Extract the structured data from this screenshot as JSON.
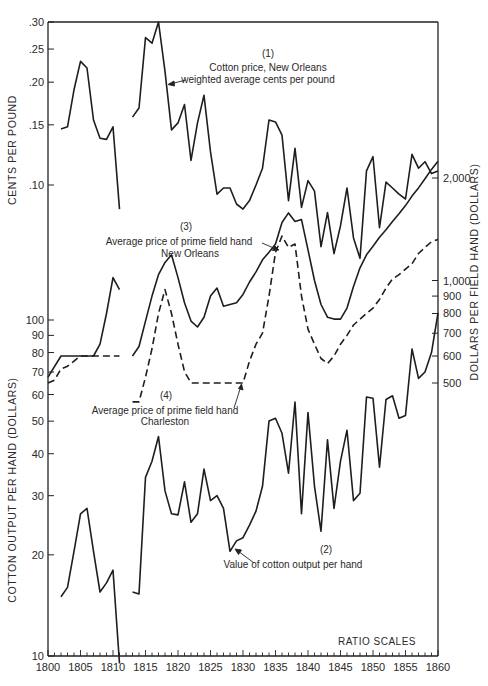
{
  "chart_data": {
    "type": "line",
    "title": "",
    "note": "RATIO SCALES",
    "x": {
      "label": "",
      "range": [
        1800,
        1860
      ],
      "ticks": [
        1800,
        1805,
        1810,
        1815,
        1820,
        1825,
        1830,
        1835,
        1840,
        1845,
        1850,
        1855,
        1860
      ]
    },
    "axes": {
      "left_top": {
        "label": "CENTS PER POUND",
        "ticks": [
          ".30",
          ".25",
          ".20",
          ".15",
          ".10"
        ],
        "scale": "log"
      },
      "left_bottom": {
        "label": "COTTON OUTPUT PER HAND (DOLLARS)",
        "ticks": [
          "100",
          "90",
          "80",
          "70",
          "60",
          "50",
          "40",
          "30",
          "20",
          "10"
        ],
        "scale": "log"
      },
      "right": {
        "label": "DOLLARS PER FIELD HAND (DOLLARS)",
        "ticks": [
          "2,000",
          "1,000",
          "900",
          "800",
          "700",
          "600",
          "500"
        ],
        "scale": "log"
      }
    },
    "grid": false,
    "series": [
      {
        "id": 1,
        "name": "Cotton price, New Orleans weighted average cents per pound",
        "label_number": "(1)",
        "label_lines": [
          "Cotton price, New Orleans",
          "weighted average cents per pound"
        ],
        "axis": "left_top",
        "style": "solid",
        "segments": [
          {
            "x": [
              1802,
              1803,
              1804,
              1805,
              1806,
              1807,
              1808,
              1809,
              1810,
              1811
            ],
            "y": [
              0.146,
              0.148,
              0.19,
              0.23,
              0.22,
              0.155,
              0.137,
              0.136,
              0.148,
              0.085
            ]
          },
          {
            "x": [
              1813,
              1814,
              1815,
              1816,
              1817,
              1818,
              1819,
              1820,
              1821,
              1822,
              1823,
              1824,
              1825,
              1826,
              1827,
              1828,
              1829,
              1830,
              1831,
              1832,
              1833,
              1834,
              1835,
              1836,
              1837,
              1838,
              1839,
              1840,
              1841,
              1842,
              1843,
              1844,
              1845,
              1846,
              1847,
              1848,
              1849,
              1850,
              1851,
              1852,
              1853,
              1854,
              1855,
              1856,
              1857,
              1858,
              1859,
              1860
            ],
            "y": [
              0.158,
              0.168,
              0.27,
              0.26,
              0.3,
              0.215,
              0.145,
              0.152,
              0.172,
              0.118,
              0.152,
              0.183,
              0.125,
              0.094,
              0.098,
              0.098,
              0.088,
              0.085,
              0.09,
              0.1,
              0.112,
              0.155,
              0.153,
              0.14,
              0.09,
              0.128,
              0.086,
              0.103,
              0.096,
              0.066,
              0.083,
              0.063,
              0.076,
              0.098,
              0.07,
              0.061,
              0.11,
              0.121,
              0.075,
              0.102,
              0.098,
              0.094,
              0.091,
              0.123,
              0.112,
              0.117,
              0.108,
              0.11
            ]
          }
        ]
      },
      {
        "id": 2,
        "name": "Value of cotton output per hand",
        "label_number": "(2)",
        "label_lines": [
          "Value of cotton output per hand"
        ],
        "axis": "left_bottom",
        "style": "solid",
        "segments": [
          {
            "x": [
              1802,
              1803,
              1804,
              1805,
              1806,
              1807,
              1808,
              1809,
              1810,
              1811
            ],
            "y": [
              15,
              16,
              20.5,
              26.5,
              27.5,
              20.5,
              15.5,
              16.5,
              18,
              9.5
            ]
          },
          {
            "x": [
              1813,
              1814,
              1815,
              1816,
              1817,
              1818,
              1819,
              1820,
              1821,
              1822,
              1823,
              1824,
              1825,
              1826,
              1827,
              1828,
              1829,
              1830,
              1831,
              1832,
              1833,
              1834,
              1835,
              1836,
              1837,
              1838,
              1839,
              1840,
              1841,
              1842,
              1843,
              1844,
              1845,
              1846,
              1847,
              1848,
              1849,
              1850,
              1851,
              1852,
              1853,
              1854,
              1855,
              1856,
              1857,
              1858,
              1859,
              1860
            ],
            "y": [
              15.5,
              15.3,
              34,
              38,
              45,
              31,
              26.5,
              26.3,
              33,
              25,
              26.5,
              36,
              29,
              30,
              27.5,
              20.5,
              22,
              22.5,
              24.5,
              27,
              32,
              50,
              51,
              46,
              35,
              57,
              26.5,
              53,
              32,
              23.5,
              44,
              27.5,
              38,
              47,
              29,
              30.5,
              59,
              58.5,
              36.5,
              58,
              59.5,
              51,
              52,
              82,
              67,
              70,
              80,
              105
            ]
          }
        ]
      },
      {
        "id": 3,
        "name": "Average price of prime field hand New Orleans",
        "label_number": "(3)",
        "label_lines": [
          "Average price of prime field hand",
          "New Orleans"
        ],
        "axis": "right",
        "style": "solid",
        "segments": [
          {
            "x": [
              1800,
              1802,
              1806,
              1807,
              1808,
              1809,
              1810,
              1811
            ],
            "y": [
              520,
              600,
              600,
              600,
              650,
              800,
              1020,
              940
            ]
          },
          {
            "x": [
              1813,
              1814,
              1815,
              1816,
              1817,
              1818,
              1819,
              1820,
              1821,
              1822,
              1823,
              1824,
              1825,
              1826,
              1827,
              1828,
              1829,
              1830,
              1831,
              1832,
              1833,
              1834,
              1835,
              1836,
              1837,
              1838,
              1839,
              1840,
              1841,
              1842,
              1843,
              1844,
              1845,
              1846,
              1847,
              1848,
              1849,
              1850,
              1851,
              1852,
              1853,
              1854,
              1855,
              1856,
              1857,
              1858,
              1859,
              1860
            ],
            "y": [
              600,
              640,
              760,
              900,
              1040,
              1130,
              1190,
              1020,
              860,
              760,
              730,
              780,
              900,
              950,
              840,
              850,
              860,
              910,
              990,
              1060,
              1150,
              1210,
              1280,
              1480,
              1580,
              1490,
              1510,
              1230,
              1000,
              850,
              780,
              770,
              770,
              830,
              960,
              1090,
              1190,
              1260,
              1340,
              1410,
              1490,
              1570,
              1660,
              1770,
              1870,
              1990,
              2120,
              2240
            ]
          }
        ]
      },
      {
        "id": 4,
        "name": "Average price of prime field hand Charleston",
        "label_number": "(4)",
        "label_lines": [
          "Average price of prime field hand",
          "Charleston"
        ],
        "axis": "right",
        "style": "dashed",
        "segments": [
          {
            "x": [
              1800,
              1801,
              1802,
              1803,
              1804,
              1805,
              1806,
              1807,
              1808,
              1809,
              1810,
              1811
            ],
            "y": [
              500,
              510,
              550,
              560,
              580,
              600,
              600,
              600,
              600,
              600,
              600,
              600
            ]
          },
          {
            "x": [
              1813,
              1814,
              1815,
              1816,
              1817,
              1818,
              1819,
              1820,
              1821,
              1822,
              1823,
              1824,
              1825,
              1826,
              1827,
              1828,
              1829,
              1830,
              1831,
              1832,
              1833,
              1834,
              1835,
              1836,
              1837,
              1838,
              1839,
              1840,
              1841,
              1842,
              1843,
              1844,
              1845,
              1846,
              1847,
              1848,
              1849,
              1850,
              1851,
              1852,
              1853,
              1854,
              1855,
              1856,
              1857,
              1858,
              1859,
              1860
            ],
            "y": [
              440,
              440,
              520,
              630,
              800,
              940,
              800,
              650,
              540,
              500,
              500,
              500,
              500,
              500,
              500,
              500,
              500,
              500,
              580,
              650,
              700,
              900,
              1210,
              1350,
              1250,
              1280,
              900,
              720,
              650,
              590,
              570,
              600,
              650,
              690,
              740,
              770,
              800,
              830,
              880,
              950,
              1010,
              1040,
              1080,
              1120,
              1200,
              1250,
              1300,
              1320
            ]
          }
        ]
      }
    ]
  },
  "labels": {
    "left_top_axis": "CENTS PER POUND",
    "left_bottom_axis": "COTTON OUTPUT PER HAND (DOLLARS)",
    "right_axis": "DOLLARS PER FIELD HAND (DOLLARS)",
    "ratio_scales": "RATIO SCALES",
    "s1_num": "(1)",
    "s1_line1": "Cotton price, New Orleans",
    "s1_line2": "weighted average cents per pound",
    "s2_num": "(2)",
    "s2_line1": "Value of cotton output per hand",
    "s3_num": "(3)",
    "s3_line1": "Average price of prime field hand",
    "s3_line2": "New Orleans",
    "s4_num": "(4)",
    "s4_line1": "Average price of prime field hand",
    "s4_line2": "Charleston"
  }
}
